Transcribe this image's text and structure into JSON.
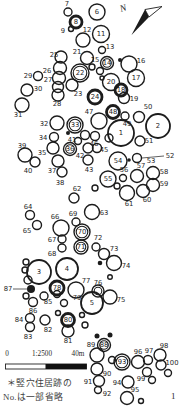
{
  "colors": {
    "ink": "#1c1c1c",
    "paper": "#ffffff",
    "bar_fill": "#111111"
  },
  "north": {
    "label": "N"
  },
  "scale": {
    "zero": "0",
    "ratio": "1:2500",
    "unit": "40m"
  },
  "caption": {
    "line1": "＊竪穴住居跡の",
    "line2": "No.は一部省略"
  },
  "page_number": "1",
  "map": {
    "leaders": [
      {
        "x1": 142,
        "y1": 158,
        "x2": 164,
        "y2": 156
      },
      {
        "x1": 13,
        "y1": 289,
        "x2": 27,
        "y2": 289
      }
    ],
    "circles": [
      {
        "label": "1",
        "cx": 121,
        "cy": 133,
        "r": 13,
        "style": "plain",
        "inside": true
      },
      {
        "label": "2",
        "cx": 158,
        "cy": 126,
        "r": 12,
        "style": "plain",
        "inside": true
      },
      {
        "label": "3",
        "cx": 39,
        "cy": 272,
        "r": 12,
        "style": "plain",
        "inside": true
      },
      {
        "label": "4",
        "cx": 67,
        "cy": 269,
        "r": 11,
        "style": "plain",
        "inside": true
      },
      {
        "label": "5",
        "cx": 92,
        "cy": 303,
        "r": 11,
        "style": "plain",
        "inside": true
      },
      {
        "label": "6",
        "cx": 97,
        "cy": 12,
        "r": 8,
        "style": "plain",
        "inside": true
      },
      {
        "label": "7",
        "cx": 68,
        "cy": 12,
        "r": 4,
        "style": "plain",
        "lx": 67,
        "ly": 4
      },
      {
        "label": "8",
        "cx": 76,
        "cy": 22,
        "r": 6,
        "style": "ring",
        "inside": true
      },
      {
        "label": "9",
        "cx": 71,
        "cy": 29,
        "r": 2.5,
        "style": "plain",
        "lx": 63,
        "ly": 31
      },
      {
        "label": "11",
        "cx": 101,
        "cy": 34,
        "r": 8.5,
        "style": "plain",
        "inside": true
      },
      {
        "label": "12",
        "cx": 83,
        "cy": 40,
        "r": 7,
        "style": "plain",
        "lx": 87,
        "ly": 30
      },
      {
        "label": "13",
        "cx": 102,
        "cy": 50,
        "r": 3.5,
        "style": "plain",
        "lx": 110,
        "ly": 47
      },
      {
        "label": "14",
        "cx": 107,
        "cy": 63,
        "r": 6.5,
        "style": "double",
        "inside": true
      },
      {
        "label": "15",
        "cx": 92,
        "cy": 67,
        "r": 3,
        "style": "plain",
        "lx": 95,
        "ly": 60
      },
      {
        "label": "16",
        "cx": 129,
        "cy": 64,
        "r": 8,
        "style": "plain",
        "lx": 141,
        "ly": 61
      },
      {
        "label": "17",
        "cx": 136,
        "cy": 78,
        "r": 8.5,
        "style": "plain",
        "inside": true
      },
      {
        "label": "18",
        "cx": 121,
        "cy": 90,
        "r": 6,
        "style": "ring",
        "inside": true
      },
      {
        "label": "19",
        "cx": 124,
        "cy": 98,
        "r": 5.5,
        "style": "plain",
        "lx": 134,
        "ly": 99
      },
      {
        "label": "20",
        "cx": 111,
        "cy": 82,
        "r": 8.5,
        "style": "plain",
        "inside": true
      },
      {
        "label": "21",
        "cx": 87,
        "cy": 58,
        "r": 6.5,
        "style": "plain",
        "lx": 77,
        "ly": 52
      },
      {
        "label": "22",
        "cx": 80,
        "cy": 73,
        "r": 9,
        "style": "double",
        "inside": true
      },
      {
        "label": "23",
        "cx": 72,
        "cy": 85,
        "r": 6,
        "style": "plain",
        "lx": 78,
        "ly": 94
      },
      {
        "label": "24",
        "cx": 95,
        "cy": 97,
        "r": 7,
        "style": "ring",
        "inside": true
      },
      {
        "label": "25",
        "cx": 61,
        "cy": 57,
        "r": 6,
        "style": "plain",
        "lx": 54,
        "ly": 55
      },
      {
        "label": "26",
        "cx": 60,
        "cy": 68,
        "r": 6.5,
        "style": "plain",
        "lx": 47,
        "ly": 71
      },
      {
        "label": "27",
        "cx": 59,
        "cy": 78,
        "r": 6.5,
        "style": "plain",
        "lx": 48,
        "ly": 80
      },
      {
        "label": "",
        "cx": 58,
        "cy": 87,
        "r": 5.5,
        "style": "plain"
      },
      {
        "label": "28",
        "cx": 58,
        "cy": 95,
        "r": 6,
        "style": "plain",
        "lx": 57,
        "ly": 104
      },
      {
        "label": "29",
        "cx": 38,
        "cy": 76,
        "r": 4.5,
        "style": "plain",
        "lx": 28,
        "ly": 76
      },
      {
        "label": "30",
        "cx": 27,
        "cy": 90,
        "r": 6,
        "style": "plain",
        "lx": 38,
        "ly": 89
      },
      {
        "label": "31",
        "cx": 22,
        "cy": 105,
        "r": 7,
        "style": "plain",
        "lx": 18,
        "ly": 115
      },
      {
        "label": "32",
        "cx": 57,
        "cy": 123,
        "r": 7,
        "style": "plain",
        "lx": 44,
        "ly": 124
      },
      {
        "label": "33",
        "cx": 75,
        "cy": 125,
        "r": 8,
        "style": "double",
        "inside": true
      },
      {
        "label": "34",
        "cx": 54,
        "cy": 137,
        "r": 4.5,
        "style": "plain",
        "lx": 43,
        "ly": 138
      },
      {
        "label": "35",
        "cx": 53,
        "cy": 148,
        "r": 6,
        "style": "plain",
        "lx": 42,
        "ly": 153
      },
      {
        "label": "36",
        "cx": 70,
        "cy": 149,
        "r": 6.5,
        "style": "double",
        "inside": true
      },
      {
        "label": "37",
        "cx": 58,
        "cy": 161,
        "r": 6,
        "style": "plain",
        "lx": 52,
        "ly": 171
      },
      {
        "label": "38",
        "cx": 62,
        "cy": 172,
        "r": 5,
        "style": "plain",
        "lx": 60,
        "ly": 183
      },
      {
        "label": "39",
        "cx": 25,
        "cy": 155,
        "r": 7,
        "style": "plain",
        "lx": 22,
        "ly": 146
      },
      {
        "label": "40",
        "cx": 35,
        "cy": 162,
        "r": 5,
        "style": "plain",
        "lx": 28,
        "ly": 171
      },
      {
        "label": "41",
        "cx": 78,
        "cy": 141,
        "r": 3.5,
        "style": "plain",
        "lx": 72,
        "ly": 140
      },
      {
        "label": "42",
        "cx": 88,
        "cy": 148,
        "r": 5,
        "style": "plain",
        "lx": 80,
        "ly": 156
      },
      {
        "label": "43",
        "cx": 88,
        "cy": 160,
        "r": 5,
        "style": "plain",
        "lx": 89,
        "ly": 170
      },
      {
        "label": "45",
        "cx": 109,
        "cy": 138,
        "r": 4,
        "style": "plain",
        "lx": 104,
        "ly": 150
      },
      {
        "label": "46",
        "cx": 95,
        "cy": 136,
        "r": 4.5,
        "style": "plain",
        "lx": 94,
        "ly": 144
      },
      {
        "label": "47",
        "cx": 99,
        "cy": 121,
        "r": 8,
        "style": "plain",
        "lx": 89,
        "ly": 112
      },
      {
        "label": "48",
        "cx": 113,
        "cy": 112,
        "r": 6.5,
        "style": "ring",
        "inside": true
      },
      {
        "label": "49",
        "cx": 125,
        "cy": 116,
        "r": 4,
        "style": "plain",
        "lx": 127,
        "ly": 124
      },
      {
        "label": "50",
        "cx": 139,
        "cy": 117,
        "r": 5.5,
        "style": "plain",
        "lx": 148,
        "ly": 107
      },
      {
        "label": "51",
        "cx": 140,
        "cy": 141,
        "r": 5,
        "style": "plain",
        "lx": 149,
        "ly": 141
      },
      {
        "label": "52",
        "style": "none",
        "lx": 170,
        "ly": 156
      },
      {
        "label": "53",
        "cx": 137,
        "cy": 158,
        "r": 4.5,
        "style": "plain",
        "lx": 151,
        "ly": 161
      },
      {
        "label": "54",
        "cx": 118,
        "cy": 161,
        "r": 9,
        "style": "plain",
        "inside": true
      },
      {
        "label": "55",
        "cx": 108,
        "cy": 179,
        "r": 8,
        "style": "plain",
        "inside": true
      },
      {
        "label": "56",
        "cx": 123,
        "cy": 178,
        "r": 3.5,
        "style": "plain",
        "lx": 124,
        "ly": 170
      },
      {
        "label": "57",
        "cx": 137,
        "cy": 176,
        "r": 6.5,
        "style": "plain",
        "lx": 141,
        "ly": 166
      },
      {
        "label": "58",
        "cx": 153,
        "cy": 173,
        "r": 6.5,
        "style": "plain",
        "lx": 164,
        "ly": 172
      },
      {
        "label": "59",
        "cx": 153,
        "cy": 185,
        "r": 6.5,
        "style": "plain",
        "lx": 164,
        "ly": 184
      },
      {
        "label": "60",
        "cx": 143,
        "cy": 191,
        "r": 6.5,
        "style": "plain",
        "lx": 147,
        "ly": 200
      },
      {
        "label": "61",
        "cx": 127,
        "cy": 193,
        "r": 7.5,
        "style": "plain",
        "lx": 129,
        "ly": 204
      },
      {
        "label": "62",
        "cx": 74,
        "cy": 198,
        "r": 5,
        "style": "plain",
        "lx": 77,
        "ly": 189
      },
      {
        "label": "63",
        "cx": 92,
        "cy": 212,
        "r": 7.5,
        "style": "plain",
        "lx": 104,
        "ly": 213
      },
      {
        "label": "64",
        "cx": 30,
        "cy": 215,
        "r": 4.5,
        "style": "plain",
        "lx": 28,
        "ly": 207
      },
      {
        "label": "65",
        "cx": 37,
        "cy": 225,
        "r": 4.5,
        "style": "plain",
        "lx": 27,
        "ly": 231
      },
      {
        "label": "66",
        "cx": 61,
        "cy": 228,
        "r": 8,
        "style": "plain",
        "lx": 55,
        "ly": 217
      },
      {
        "label": "67",
        "cx": 62,
        "cy": 239,
        "r": 4,
        "style": "plain",
        "lx": 52,
        "ly": 240
      },
      {
        "label": "68",
        "cx": 62,
        "cy": 248,
        "r": 4,
        "style": "plain",
        "lx": 52,
        "ly": 254
      },
      {
        "label": "69",
        "cx": 76,
        "cy": 222,
        "r": 4,
        "style": "plain",
        "lx": 73,
        "ly": 214
      },
      {
        "label": "70",
        "cx": 82,
        "cy": 232,
        "r": 8,
        "style": "double",
        "inside": true
      },
      {
        "label": "71",
        "cx": 81,
        "cy": 247,
        "r": 7,
        "style": "double",
        "inside": true
      },
      {
        "label": "72",
        "cx": 96,
        "cy": 247,
        "r": 4,
        "style": "plain",
        "lx": 98,
        "ly": 238
      },
      {
        "label": "73",
        "cx": 104,
        "cy": 254,
        "r": 5.5,
        "style": "plain",
        "lx": 114,
        "ly": 249
      },
      {
        "label": "74",
        "cx": 114,
        "cy": 263,
        "r": 7.5,
        "style": "plain",
        "lx": 126,
        "ly": 266
      },
      {
        "label": "75",
        "cx": 110,
        "cy": 297,
        "r": 7,
        "style": "plain",
        "lx": 121,
        "ly": 300
      },
      {
        "label": "76",
        "cx": 98,
        "cy": 291,
        "r": 6,
        "style": "double",
        "lx": 98,
        "ly": 283
      },
      {
        "label": "77",
        "cx": 76,
        "cy": 290,
        "r": 8,
        "style": "plain",
        "lx": 86,
        "ly": 281
      },
      {
        "label": "78",
        "cx": 57,
        "cy": 288,
        "r": 7,
        "style": "ring",
        "inside": true
      },
      {
        "label": "79",
        "cx": 64,
        "cy": 303,
        "r": 3.5,
        "style": "plain",
        "lx": 77,
        "ly": 298
      },
      {
        "label": "80",
        "cx": 68,
        "cy": 320,
        "r": 6.5,
        "style": "ring",
        "inside": true
      },
      {
        "label": "81",
        "cx": 68,
        "cy": 331,
        "r": 6,
        "style": "plain",
        "lx": 68,
        "ly": 341
      },
      {
        "label": "82",
        "cx": 45,
        "cy": 320,
        "r": 5,
        "style": "plain",
        "lx": 48,
        "ly": 330
      },
      {
        "label": "83",
        "cx": 30,
        "cy": 327,
        "r": 4.5,
        "style": "plain",
        "lx": 28,
        "ly": 337
      },
      {
        "label": "84",
        "cx": 30,
        "cy": 318,
        "r": 4.5,
        "style": "plain",
        "lx": 19,
        "ly": 320
      },
      {
        "label": "85",
        "cx": 44,
        "cy": 296,
        "r": 4,
        "style": "plain",
        "lx": 48,
        "ly": 302
      },
      {
        "label": "86",
        "cx": 33,
        "cy": 302,
        "r": 4.5,
        "style": "plain",
        "lx": 33,
        "ly": 311
      },
      {
        "label": "87",
        "style": "none",
        "lx": 8,
        "ly": 289
      },
      {
        "label": "88",
        "cx": 104,
        "cy": 345,
        "r": 6.5,
        "style": "double",
        "inside": true
      },
      {
        "label": "89",
        "style": "none",
        "lx": 91,
        "ly": 345
      },
      {
        "label": "90",
        "cx": 97,
        "cy": 369,
        "r": 6,
        "style": "plain",
        "lx": 107,
        "ly": 374
      },
      {
        "label": "91",
        "cx": 99,
        "cy": 381,
        "r": 5.5,
        "style": "plain",
        "lx": 88,
        "ly": 382
      },
      {
        "label": "92",
        "cx": 98,
        "cy": 390,
        "r": 3.5,
        "style": "plain",
        "lx": 107,
        "ly": 394
      },
      {
        "label": "93",
        "cx": 122,
        "cy": 362,
        "r": 8,
        "style": "double",
        "inside": true
      },
      {
        "label": "94",
        "cx": 128,
        "cy": 382,
        "r": 6,
        "style": "plain",
        "lx": 117,
        "ly": 383
      },
      {
        "label": "95",
        "cx": 127,
        "cy": 398,
        "r": 6.5,
        "style": "plain",
        "lx": 135,
        "ly": 390
      },
      {
        "label": "96",
        "cx": 138,
        "cy": 362,
        "r": 6.5,
        "style": "plain",
        "lx": 138,
        "ly": 352
      },
      {
        "label": "97",
        "cx": 148,
        "cy": 360,
        "r": 4.5,
        "style": "plain",
        "lx": 149,
        "ly": 351
      },
      {
        "label": "98",
        "cx": 160,
        "cy": 355,
        "r": 6,
        "style": "plain",
        "lx": 164,
        "ly": 346
      },
      {
        "label": "99",
        "cx": 147,
        "cy": 372,
        "r": 4.5,
        "style": "plain",
        "lx": 141,
        "ly": 379
      },
      {
        "label": "100",
        "cx": 161,
        "cy": 365,
        "r": 5,
        "style": "plain",
        "lx": 172,
        "ly": 363
      },
      {
        "cx": 120,
        "cy": 60,
        "r": 2,
        "style": "dot"
      },
      {
        "cx": 100,
        "cy": 71,
        "r": 3.5,
        "style": "plain"
      },
      {
        "cx": 102,
        "cy": 78,
        "r": 2,
        "style": "plain"
      },
      {
        "cx": 68,
        "cy": 133,
        "r": 2,
        "style": "dot"
      },
      {
        "cx": 85,
        "cy": 135,
        "r": 4.5,
        "style": "plain"
      },
      {
        "cx": 97,
        "cy": 148,
        "r": 4.5,
        "style": "plain"
      },
      {
        "cx": 129,
        "cy": 160,
        "r": 1.8,
        "style": "dot"
      },
      {
        "cx": 117,
        "cy": 186,
        "r": 3,
        "style": "plain"
      },
      {
        "cx": 95,
        "cy": 188,
        "r": 3,
        "style": "plain"
      },
      {
        "cx": 100,
        "cy": 263,
        "r": 2.3,
        "style": "dot"
      },
      {
        "cx": 110,
        "cy": 277,
        "r": 2.3,
        "style": "plain"
      },
      {
        "cx": 26,
        "cy": 262,
        "r": 3,
        "style": "plain"
      },
      {
        "cx": 25,
        "cy": 270,
        "r": 3,
        "style": "plain"
      },
      {
        "cx": 28,
        "cy": 280,
        "r": 4,
        "style": "plain"
      },
      {
        "cx": 31,
        "cy": 289,
        "r": 4,
        "style": "dot"
      },
      {
        "cx": 26,
        "cy": 296,
        "r": 3,
        "style": "plain"
      },
      {
        "cx": 57,
        "cy": 294,
        "r": 3.5,
        "style": "plain"
      },
      {
        "cx": 58,
        "cy": 313,
        "r": 2.5,
        "style": "plain"
      },
      {
        "cx": 82,
        "cy": 315,
        "r": 2.5,
        "style": "plain"
      },
      {
        "cx": 85,
        "cy": 325,
        "r": 3,
        "style": "plain"
      },
      {
        "cx": 97,
        "cy": 336,
        "r": 2.5,
        "style": "dot"
      },
      {
        "cx": 110,
        "cy": 335,
        "r": 2.5,
        "style": "dot"
      },
      {
        "cx": 97,
        "cy": 355,
        "r": 7,
        "style": "plain"
      },
      {
        "cx": 112,
        "cy": 360,
        "r": 3.5,
        "style": "plain"
      },
      {
        "cx": 152,
        "cy": 380,
        "r": 3.5,
        "style": "plain"
      },
      {
        "cx": 168,
        "cy": 373,
        "r": 3.5,
        "style": "plain"
      },
      {
        "cx": 141,
        "cy": 401,
        "r": 2.5,
        "style": "plain"
      }
    ]
  }
}
